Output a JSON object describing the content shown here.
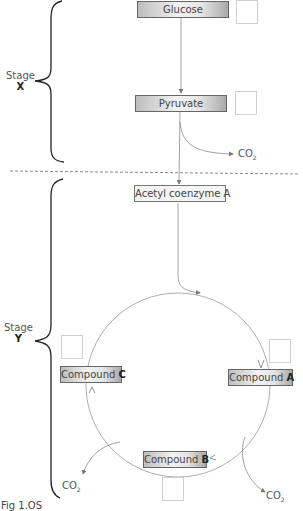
{
  "stages": [
    {
      "label": "Stage",
      "letter": "X"
    },
    {
      "label": "Stage",
      "letter": "Y"
    }
  ],
  "nodes": {
    "glucose": "Glucose",
    "pyruvate": "Pyruvate",
    "acetyl_coa": "Acetyl coenzyme A",
    "compound_a": {
      "prefix": "Compound ",
      "letter": "A"
    },
    "compound_b": {
      "prefix": "Compound ",
      "letter": "B"
    },
    "compound_c": {
      "prefix": "Compound ",
      "letter": "C"
    }
  },
  "products": {
    "co2_base": "CO",
    "co2_sub": "2"
  },
  "answer_boxes": [
    "glucose",
    "pyruvate",
    "compound_a",
    "compound_b",
    "compound_c"
  ],
  "caption": "Fig 1.OS",
  "colors": {
    "box_border": "#666666",
    "arrow": "#8a8a8a",
    "brace": "#222222",
    "divider": "#888888"
  }
}
